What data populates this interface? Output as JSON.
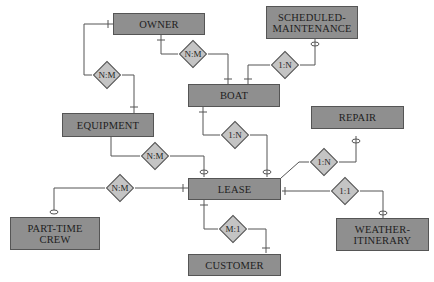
{
  "diagram": {
    "type": "entity-relationship",
    "entities": [
      {
        "id": "owner",
        "label": "OWNER"
      },
      {
        "id": "scheduled_maintenance",
        "label": "SCHEDULED-\nMAINTENANCE",
        "line1": "SCHEDULED-",
        "line2": "MAINTENANCE"
      },
      {
        "id": "boat",
        "label": "BOAT"
      },
      {
        "id": "equipment",
        "label": "EQUIPMENT"
      },
      {
        "id": "repair",
        "label": "REPAIR"
      },
      {
        "id": "lease",
        "label": "LEASE"
      },
      {
        "id": "part_time_crew",
        "label": "PART-TIME\nCREW",
        "line1": "PART-TIME",
        "line2": "CREW"
      },
      {
        "id": "weather_itinerary",
        "label": "WEATHER-\nITINERARY",
        "line1": "WEATHER-",
        "line2": "ITINERARY"
      },
      {
        "id": "customer",
        "label": "CUSTOMER"
      }
    ],
    "relationships": [
      {
        "id": "owner_boat",
        "label": "N:M",
        "from": "OWNER",
        "to": "BOAT"
      },
      {
        "id": "owner_equipment",
        "label": "N:M",
        "from": "OWNER",
        "to": "EQUIPMENT"
      },
      {
        "id": "boat_maintenance",
        "label": "1:N",
        "from": "BOAT",
        "to": "SCHEDULED-MAINTENANCE"
      },
      {
        "id": "boat_lease",
        "label": "1:N",
        "from": "BOAT",
        "to": "LEASE"
      },
      {
        "id": "equipment_lease",
        "label": "N:M",
        "from": "EQUIPMENT",
        "to": "LEASE"
      },
      {
        "id": "lease_repair",
        "label": "1:N",
        "from": "LEASE",
        "to": "REPAIR"
      },
      {
        "id": "crew_lease",
        "label": "N:M",
        "from": "PART-TIME CREW",
        "to": "LEASE"
      },
      {
        "id": "lease_weather",
        "label": "1:1",
        "from": "LEASE",
        "to": "WEATHER-ITINERARY"
      },
      {
        "id": "lease_customer",
        "label": "M:1",
        "from": "LEASE",
        "to": "CUSTOMER"
      }
    ]
  }
}
